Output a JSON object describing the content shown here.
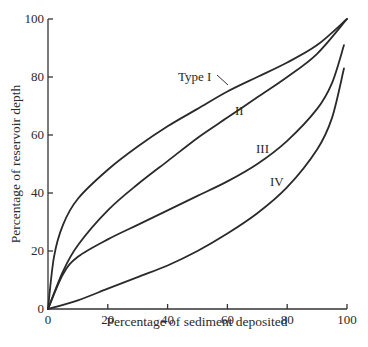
{
  "chart_data": {
    "type": "line",
    "title": "",
    "xlabel": "Percentage of sediment deposited",
    "ylabel": "Percentage of reservoir depth",
    "xlim": [
      0,
      100
    ],
    "ylim": [
      0,
      100
    ],
    "x_ticks": [
      "0",
      "20",
      "40",
      "60",
      "80",
      "100"
    ],
    "y_ticks": [
      "0",
      "20",
      "40",
      "60",
      "80",
      "100"
    ],
    "grid": false,
    "legend": "inline curve labels",
    "series": [
      {
        "name": "Type I",
        "label": "Type I",
        "x": [
          0,
          2,
          5,
          10,
          20,
          30,
          40,
          50,
          60,
          70,
          80,
          90,
          100
        ],
        "y": [
          0,
          18,
          29,
          38,
          48,
          56,
          63,
          69,
          75,
          80,
          85,
          91,
          100
        ]
      },
      {
        "name": "II",
        "label": "II",
        "x": [
          0,
          5,
          10,
          20,
          30,
          40,
          50,
          60,
          70,
          80,
          90,
          100
        ],
        "y": [
          0,
          13,
          22,
          34,
          43,
          51,
          59,
          66,
          73,
          80,
          88,
          100
        ]
      },
      {
        "name": "III",
        "label": "III",
        "x": [
          0,
          5,
          10,
          20,
          30,
          40,
          50,
          60,
          70,
          80,
          90,
          95,
          99
        ],
        "y": [
          0,
          12,
          18,
          24,
          29,
          34,
          39,
          44,
          50,
          58,
          69,
          78,
          91
        ]
      },
      {
        "name": "IV",
        "label": "IV",
        "x": [
          0,
          10,
          20,
          30,
          40,
          50,
          60,
          70,
          80,
          90,
          95,
          99
        ],
        "y": [
          0,
          3,
          7,
          11,
          15,
          20,
          26,
          33,
          42,
          55,
          66,
          83
        ]
      }
    ]
  }
}
